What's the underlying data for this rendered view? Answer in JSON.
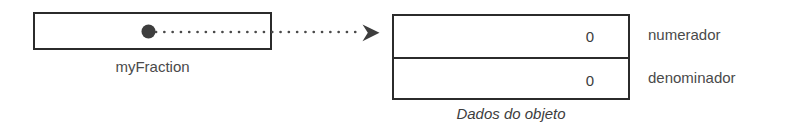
{
  "diagram": {
    "caption": "Dados do objeto",
    "reference": {
      "name": "myFraction",
      "pointer_icon": "filled-dot-icon",
      "link_icon": "dotted-arrow-icon"
    },
    "object": {
      "fields": [
        {
          "label": "numerador",
          "value": "0"
        },
        {
          "label": "denominador",
          "value": "0"
        }
      ]
    },
    "colors": {
      "background": "#ffffff",
      "stroke": "#2b2b2b",
      "text": "#3d3d3d",
      "label_text": "#4a4a4a"
    }
  }
}
